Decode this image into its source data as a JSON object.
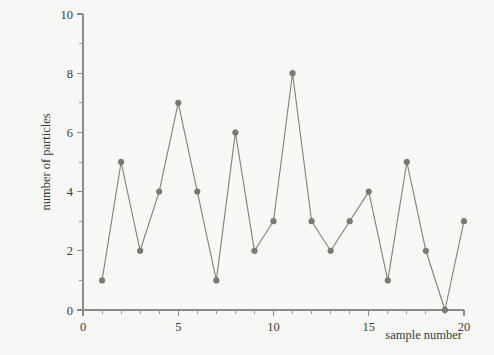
{
  "figure": {
    "background_color": "#f7f7f5",
    "ink_color": "#8a8279",
    "axis_color": "#8b8b86",
    "text_color": "#3a3a38"
  },
  "chart_data": {
    "type": "line",
    "title": "",
    "subtitle": "",
    "xlabel": "sample number",
    "ylabel": "number of particles",
    "x": [
      1,
      2,
      3,
      4,
      5,
      6,
      7,
      8,
      9,
      10,
      11,
      12,
      13,
      14,
      15,
      16,
      17,
      18,
      19,
      20
    ],
    "values": [
      1,
      5,
      2,
      4,
      7,
      4,
      1,
      6,
      2,
      3,
      8,
      3,
      2,
      3,
      4,
      1,
      5,
      2,
      0,
      3
    ],
    "series": [
      {
        "name": "number of particles",
        "values": [
          1,
          5,
          2,
          4,
          7,
          4,
          1,
          6,
          2,
          3,
          8,
          3,
          2,
          3,
          4,
          1,
          5,
          2,
          0,
          3
        ]
      }
    ],
    "xlim": [
      0,
      20
    ],
    "ylim": [
      0,
      10
    ],
    "x_ticks_major": [
      0,
      5,
      10,
      15,
      20
    ],
    "x_tick_labels": [
      "0",
      "5",
      "10",
      "15",
      "20"
    ],
    "x_ticks_minor": [
      1,
      2,
      3,
      4,
      6,
      7,
      8,
      9,
      11,
      12,
      13,
      14,
      16,
      17,
      18,
      19
    ],
    "y_ticks_major": [
      0,
      2,
      4,
      6,
      8,
      10
    ],
    "y_tick_labels": [
      "0",
      "2",
      "4",
      "6",
      "8",
      "10"
    ],
    "y_ticks_minor": [
      1,
      3,
      5,
      7,
      9
    ],
    "grid": false,
    "legend": false,
    "legend_position": "none",
    "marker": "filled-circle",
    "annotations": []
  }
}
